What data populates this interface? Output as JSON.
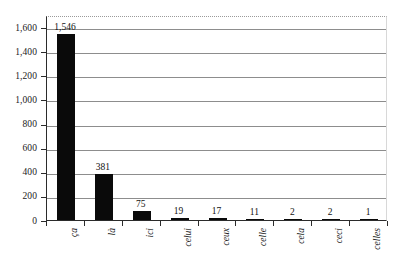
{
  "chart_data": {
    "type": "bar",
    "title": "",
    "subtitle": "",
    "xlabel": "",
    "ylabel": "",
    "categories": [
      "ça",
      "là",
      "ici",
      "celui",
      "ceux",
      "celle",
      "cela",
      "ceci",
      "celles"
    ],
    "values": [
      1546,
      381,
      75,
      19,
      17,
      11,
      2,
      2,
      1
    ],
    "value_labels": [
      "1,546",
      "381",
      "75",
      "19",
      "17",
      "11",
      "2",
      "2",
      "1"
    ],
    "ylim": [
      0,
      1700
    ],
    "yticks": [
      0,
      200,
      400,
      600,
      800,
      1000,
      1200,
      1400,
      1600
    ],
    "ytick_labels": [
      "0",
      "200",
      "400",
      "600",
      "800",
      "1,000",
      "1,200",
      "1,400",
      "1,600"
    ],
    "grid": true,
    "grid_axis": "y",
    "legend": "none",
    "bar_color": "#0a0a0a",
    "gridline_color": "#8d8d8d",
    "axis_color": "#2b2b2b",
    "background_color": "#ffffff"
  }
}
